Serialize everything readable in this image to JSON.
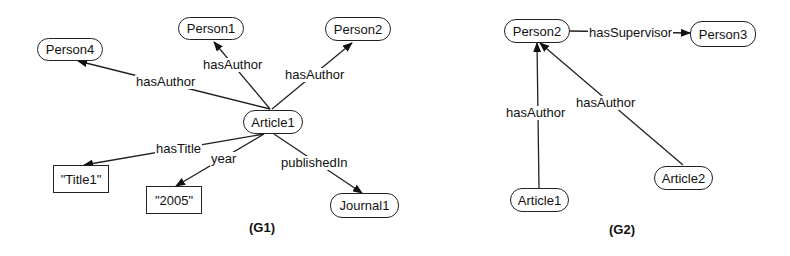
{
  "graphs": [
    {
      "caption": "(G1)",
      "nodes": {
        "person4": "Person4",
        "person1": "Person1",
        "person2": "Person2",
        "article1": "Article1",
        "title1": "\"Title1\"",
        "year2005": "\"2005\"",
        "journal1": "Journal1"
      },
      "edges": {
        "a1_p4": "hasAuthor",
        "a1_p1": "hasAuthor",
        "a1_p2": "hasAuthor",
        "a1_title": "hasTitle",
        "a1_year": "year",
        "a1_journal": "publishedIn"
      }
    },
    {
      "caption": "(G2)",
      "nodes": {
        "person2": "Person2",
        "person3": "Person3",
        "article1": "Article1",
        "article2": "Article2"
      },
      "edges": {
        "p2_p3": "hasSupervisor",
        "a1_p2": "hasAuthor",
        "a2_p2": "hasAuthor"
      }
    }
  ],
  "colors": {
    "line": "#222222",
    "background": "#ffffff"
  }
}
